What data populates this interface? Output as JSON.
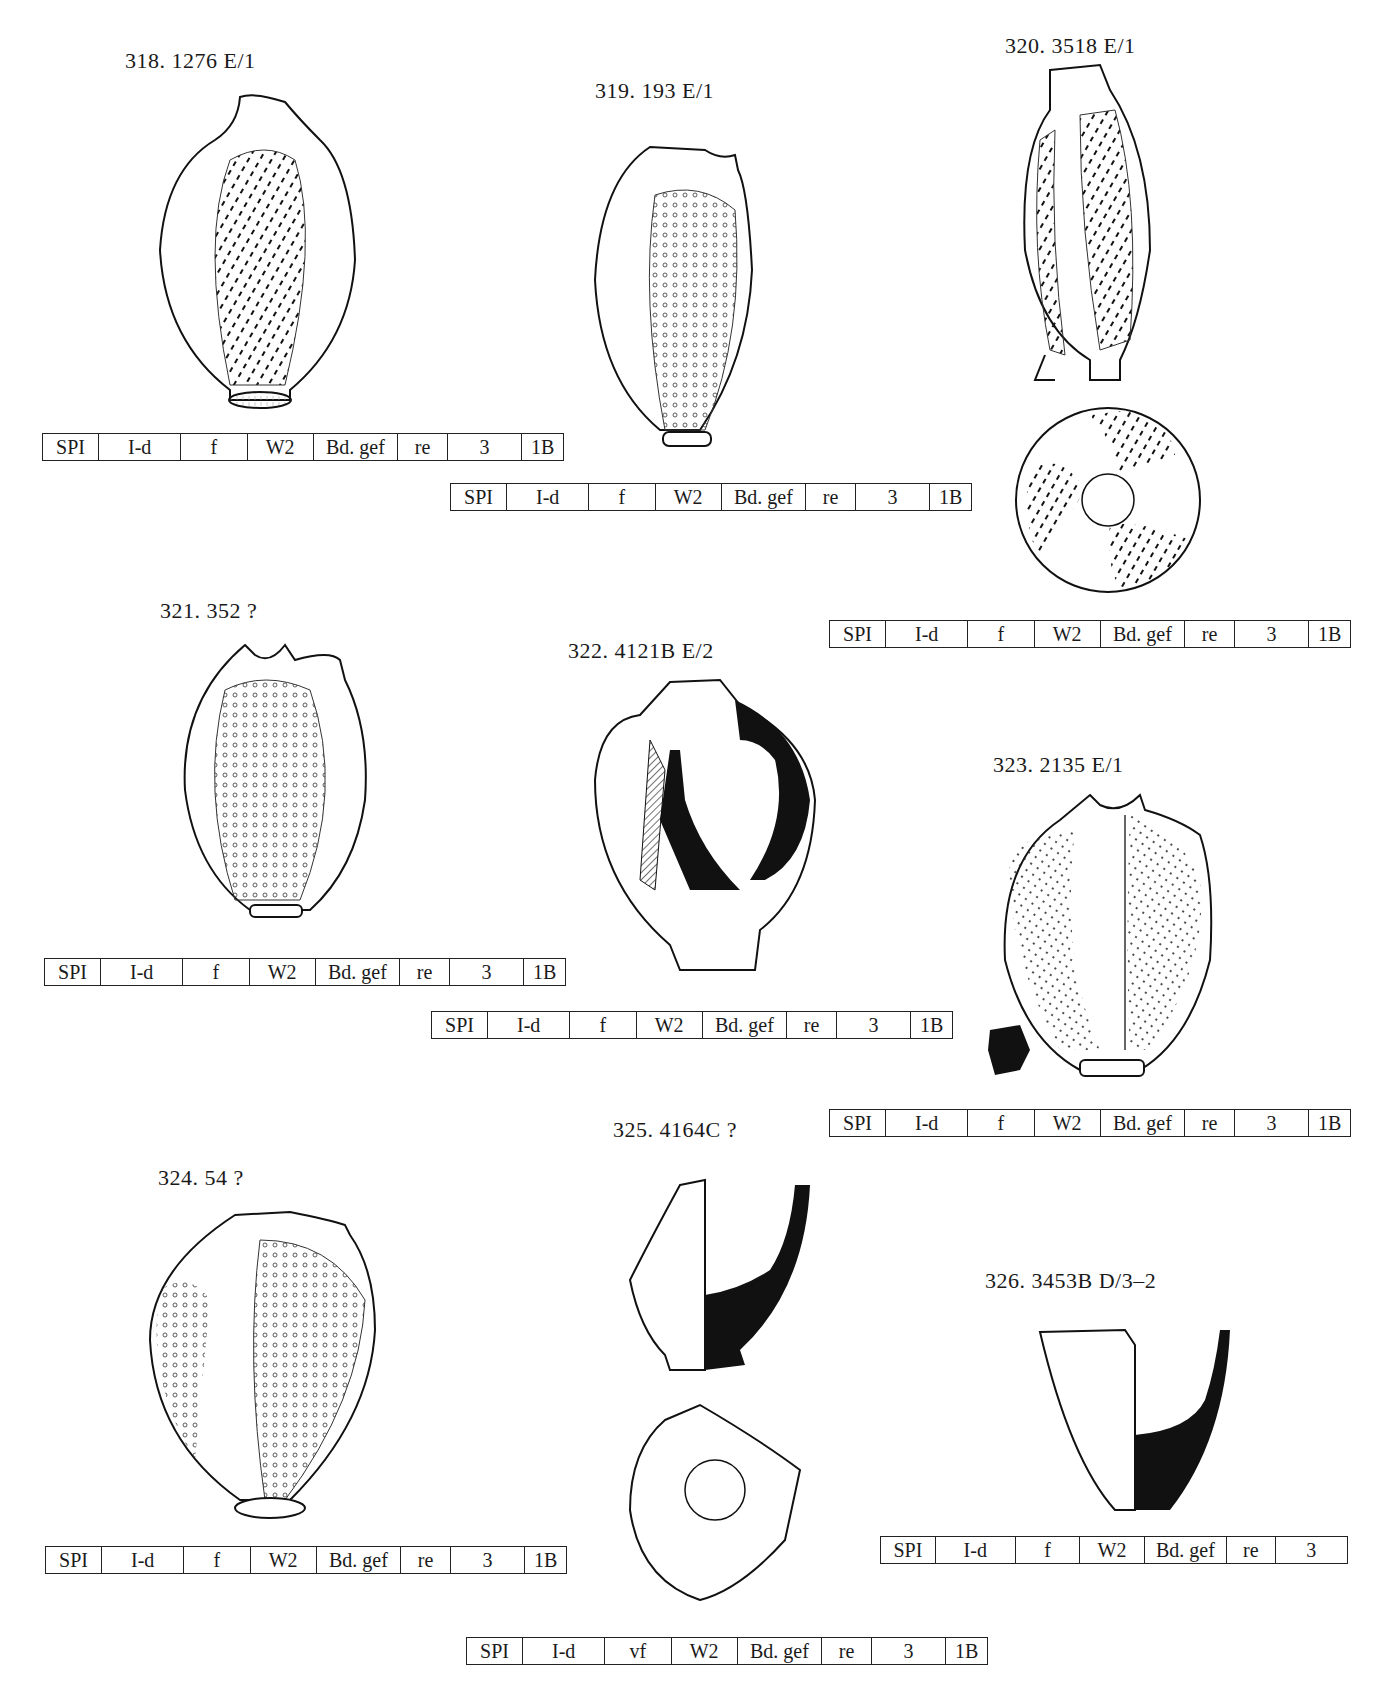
{
  "page": {
    "running_head": "g                    ,"
  },
  "figures": [
    {
      "id": "318",
      "label": "318.  1276  E/1",
      "codes": [
        "SPI",
        "I-d",
        "f",
        "W2",
        "Bd. gef",
        "re",
        "3",
        "1B"
      ]
    },
    {
      "id": "319",
      "label": "319.  193  E/1",
      "codes": [
        "SPI",
        "I-d",
        "f",
        "W2",
        "Bd. gef",
        "re",
        "3",
        "1B"
      ]
    },
    {
      "id": "320",
      "label": "320.  3518  E/1",
      "codes": [
        "SPI",
        "I-d",
        "f",
        "W2",
        "Bd. gef",
        "re",
        "3",
        "1B"
      ]
    },
    {
      "id": "321",
      "label": "321.  352  ?",
      "codes": [
        "SPI",
        "I-d",
        "f",
        "W2",
        "Bd. gef",
        "re",
        "3",
        "1B"
      ]
    },
    {
      "id": "322",
      "label": "322.  4121B  E/2",
      "codes": [
        "SPI",
        "I-d",
        "f",
        "W2",
        "Bd. gef",
        "re",
        "3",
        "1B"
      ]
    },
    {
      "id": "323",
      "label": "323.  2135  E/1",
      "codes": [
        "SPI",
        "I-d",
        "f",
        "W2",
        "Bd. gef",
        "re",
        "3",
        "1B"
      ]
    },
    {
      "id": "324",
      "label": "324.  54  ?",
      "codes": [
        "SPI",
        "I-d",
        "f",
        "W2",
        "Bd. gef",
        "re",
        "3",
        "1B"
      ]
    },
    {
      "id": "325",
      "label": "325.  4164C  ?",
      "codes": [
        "SPI",
        "I-d",
        "vf",
        "W2",
        "Bd. gef",
        "re",
        "3",
        "1B"
      ]
    },
    {
      "id": "326",
      "label": "326.  3453B  D/3–2",
      "codes": [
        "SPI",
        "I-d",
        "f",
        "W2",
        "Bd. gef",
        "re",
        "3"
      ]
    }
  ]
}
